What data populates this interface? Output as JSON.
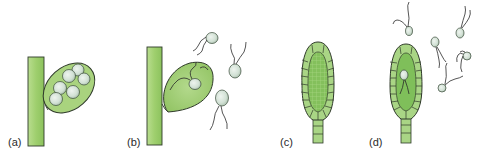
{
  "figure": {
    "panels": [
      {
        "id": "a",
        "label": "(a)",
        "description": "Sporangium on filament containing spores"
      },
      {
        "id": "b",
        "label": "(b)",
        "description": "Sporangium releasing biflagellate zoospores"
      },
      {
        "id": "c",
        "label": "(c)",
        "description": "Multicellular structure with sterile jacket layer"
      },
      {
        "id": "d",
        "label": "(d)",
        "description": "Multicellular structure releasing biflagellate cells"
      }
    ],
    "colors": {
      "filament": "#a8d27a",
      "filament_dark": "#8ec05e",
      "outline": "#2f3a2a",
      "sac_fill": "#9fcc72",
      "spore_fill": "#d8e6dc",
      "spore_shadow": "#b9cbbd",
      "jacket_cell": "#a9d585",
      "inner_fill": "#7fbf5a",
      "flagellum": "#2a2a2a",
      "label": "#2a2a2a"
    }
  }
}
